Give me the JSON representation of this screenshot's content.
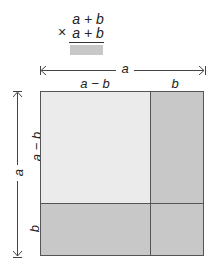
{
  "colors": {
    "light": "#ebebeb",
    "dark": "#c8c8c8",
    "border": "#555555",
    "text": "#222222"
  },
  "multiplication": {
    "operator": "×",
    "multiplicand": "a + b",
    "multiplier": "a + b"
  },
  "horizontal_dimension": {
    "label": "a",
    "segments": [
      "a − b",
      "b"
    ]
  },
  "vertical_dimension": {
    "label": "a",
    "segments": [
      "a − b",
      "b"
    ]
  },
  "arrows": {
    "left_head": "⇤",
    "right_head": "⇥"
  },
  "square": {
    "regions": [
      {
        "name": "top-left",
        "shade": "light",
        "width": "a − b",
        "height": "a − b"
      },
      {
        "name": "top-right",
        "shade": "dark",
        "width": "b",
        "height": "a − b"
      },
      {
        "name": "bottom-left",
        "shade": "dark",
        "width": "a − b",
        "height": "b"
      },
      {
        "name": "bottom-right",
        "shade": "dark",
        "width": "b",
        "height": "b"
      }
    ]
  }
}
